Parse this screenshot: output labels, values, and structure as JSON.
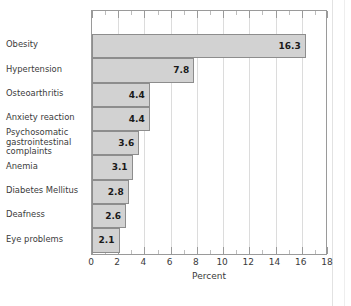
{
  "chart_data": {
    "type": "bar",
    "orientation": "horizontal",
    "title": "",
    "xlabel": "Percent",
    "ylabel": "",
    "xlim": [
      0,
      18
    ],
    "xticks": [
      0,
      2,
      4,
      6,
      8,
      10,
      12,
      14,
      16,
      18
    ],
    "xtick_labels": [
      "0",
      "2",
      "4",
      "6",
      "8",
      "10",
      "12",
      "14",
      "16",
      "18"
    ],
    "minor_tick_step": 1,
    "grid": true,
    "grid_axis": "x",
    "legend": null,
    "categories": [
      "Obesity",
      "Hypertension",
      "Osteoarthritis",
      "Anxiety reaction",
      "Psychosomatic\ngastrointestinal\ncomplaints",
      "Anemia",
      "Diabetes Mellitus",
      "Deafness",
      "Eye problems"
    ],
    "values": [
      16.3,
      7.8,
      4.4,
      4.4,
      3.6,
      3.1,
      2.8,
      2.6,
      2.1
    ],
    "value_labels": [
      "16.3",
      "7.8",
      "4.4",
      "4.4",
      "3.6",
      "3.1",
      "2.8",
      "2.6",
      "2.1"
    ]
  },
  "style": {
    "bar_fill": "#d2d2d2",
    "bar_border": "#8d8d8d",
    "grid_color": "#dcdcdc",
    "frame_color": "#9a9a9a",
    "text_color": "#3a3a3a",
    "value_color": "#1a1a1a"
  }
}
